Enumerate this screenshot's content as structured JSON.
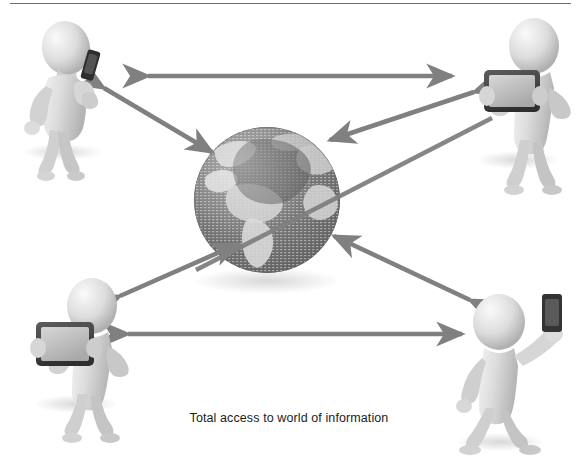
{
  "page": {
    "width": 578,
    "height": 473,
    "background": "#ffffff",
    "top_rule_color": "#6e6e6e"
  },
  "caption": {
    "text": "Total access to world of information",
    "color": "#1c1c1c"
  },
  "colors": {
    "arrow": "#808080",
    "arrow_dark": "#6f6f6f",
    "globe_ocean": "#6f6f6f",
    "globe_land": "#d8d8d8",
    "figure_body": "#d9d9d9",
    "figure_shade": "#bdbdbd",
    "device_dark": "#3a3a3a",
    "device_screen": "#c9c9c9",
    "shadow": "#e2e2e2"
  },
  "center": {
    "name": "globe",
    "label": "world-globe",
    "cx": 267,
    "cy": 200,
    "r": 73
  },
  "nodes": [
    {
      "id": "top-left",
      "name": "person-with-smartphone",
      "device": "smartphone",
      "pose": "walking-talking-on-phone",
      "x": 62,
      "y": 90
    },
    {
      "id": "top-right",
      "name": "person-with-tablet",
      "device": "tablet",
      "pose": "holding-tablet-two-hands",
      "x": 516,
      "y": 95
    },
    {
      "id": "bottom-left",
      "name": "person-with-tablet",
      "device": "tablet",
      "pose": "holding-tablet-two-hands",
      "x": 70,
      "y": 350
    },
    {
      "id": "bottom-right",
      "name": "person-with-smartphone",
      "device": "smartphone",
      "pose": "holding-phone-up-high",
      "x": 500,
      "y": 360
    }
  ],
  "connections": [
    {
      "from": "top-left",
      "to": "top-right",
      "style": "double-headed",
      "orientation": "horizontal-top"
    },
    {
      "from": "bottom-left",
      "to": "bottom-right",
      "style": "double-headed",
      "orientation": "horizontal-bottom"
    },
    {
      "from": "top-left",
      "to": "globe",
      "style": "double-headed",
      "orientation": "diagonal"
    },
    {
      "from": "top-right",
      "to": "globe",
      "style": "double-headed",
      "orientation": "diagonal"
    },
    {
      "from": "bottom-left",
      "to": "globe",
      "style": "double-headed",
      "orientation": "diagonal"
    },
    {
      "from": "bottom-right",
      "to": "globe",
      "style": "double-headed",
      "orientation": "diagonal"
    }
  ]
}
